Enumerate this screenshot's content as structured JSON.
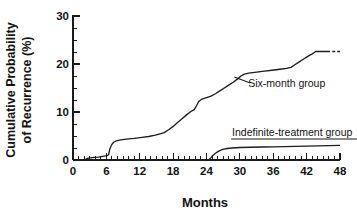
{
  "chart_data": {
    "type": "line",
    "title": "",
    "xlabel": "Months",
    "ylabel": "Cumulative Probability of Recurrence (%)",
    "ylabel_line1": "Cumulative Probability",
    "ylabel_line2": "of Recurrence (%)",
    "xlim": [
      0,
      48
    ],
    "ylim": [
      0,
      30
    ],
    "grid": false,
    "legend_position": "inline-annotations",
    "xticks": [
      0,
      6,
      12,
      18,
      24,
      30,
      36,
      42,
      48
    ],
    "xticklabels": [
      "0",
      "6",
      "12",
      "18",
      "24",
      "30",
      "36",
      "42",
      "48"
    ],
    "xminor_interval": 1,
    "yticks": [
      0,
      10,
      20,
      30
    ],
    "yticklabels": [
      "0",
      "10",
      "20",
      "30"
    ],
    "yminor_interval": 2.5,
    "series": [
      {
        "name": "Six-month group",
        "label": "Six-month group",
        "color": "#1c1c1c",
        "annotation_x": 31.5,
        "annotation_y": 15.2,
        "leader_from_x": 29.0,
        "leader_from_y": 17.3,
        "points": [
          [
            0.0,
            0.0
          ],
          [
            2.0,
            0.0
          ],
          [
            2.6,
            0.35
          ],
          [
            3.4,
            0.5
          ],
          [
            4.6,
            0.6
          ],
          [
            5.6,
            0.8
          ],
          [
            6.1,
            0.9
          ],
          [
            6.4,
            1.1
          ],
          [
            6.6,
            2.2
          ],
          [
            6.9,
            3.1
          ],
          [
            7.3,
            3.7
          ],
          [
            7.8,
            4.0
          ],
          [
            8.6,
            4.2
          ],
          [
            9.6,
            4.35
          ],
          [
            11.0,
            4.5
          ],
          [
            12.4,
            4.7
          ],
          [
            13.6,
            4.9
          ],
          [
            14.8,
            5.2
          ],
          [
            15.8,
            5.5
          ],
          [
            16.4,
            5.7
          ],
          [
            17.2,
            6.3
          ],
          [
            18.0,
            7.0
          ],
          [
            18.8,
            7.8
          ],
          [
            19.6,
            8.6
          ],
          [
            20.4,
            9.4
          ],
          [
            21.2,
            10.1
          ],
          [
            21.8,
            10.5
          ],
          [
            22.2,
            11.3
          ],
          [
            22.6,
            12.2
          ],
          [
            23.2,
            12.7
          ],
          [
            24.0,
            13.0
          ],
          [
            24.8,
            13.3
          ],
          [
            25.6,
            13.8
          ],
          [
            26.4,
            14.4
          ],
          [
            27.2,
            15.0
          ],
          [
            28.0,
            15.6
          ],
          [
            28.8,
            16.2
          ],
          [
            29.6,
            16.9
          ],
          [
            30.2,
            17.5
          ],
          [
            30.8,
            17.9
          ],
          [
            31.6,
            18.1
          ],
          [
            33.0,
            18.3
          ],
          [
            34.4,
            18.5
          ],
          [
            35.8,
            18.7
          ],
          [
            37.2,
            18.9
          ],
          [
            38.4,
            19.1
          ],
          [
            39.2,
            19.3
          ],
          [
            39.8,
            19.8
          ],
          [
            40.6,
            20.4
          ],
          [
            41.4,
            21.0
          ],
          [
            42.2,
            21.6
          ],
          [
            43.0,
            22.1
          ],
          [
            43.4,
            22.4
          ],
          [
            43.6,
            22.6
          ],
          [
            45.0,
            22.6
          ],
          [
            46.2,
            22.6
          ]
        ],
        "dashed_tail": [
          [
            46.6,
            22.6
          ],
          [
            48.0,
            22.6
          ]
        ]
      },
      {
        "name": "Indefinite-treatment group",
        "label": "Indefinite-treatment group",
        "color": "#1c1c1c",
        "annotation_x": 28.6,
        "annotation_y": 5.0,
        "leader_from_x": 27.0,
        "leader_from_y": 4.2,
        "points": [
          [
            0.0,
            0.0
          ],
          [
            12.0,
            0.0
          ],
          [
            20.0,
            0.0
          ],
          [
            24.4,
            0.0
          ],
          [
            24.7,
            0.35
          ],
          [
            25.1,
            0.9
          ],
          [
            25.6,
            1.4
          ],
          [
            26.2,
            1.85
          ],
          [
            26.9,
            2.2
          ],
          [
            27.7,
            2.4
          ],
          [
            28.6,
            2.5
          ],
          [
            30.0,
            2.6
          ],
          [
            32.0,
            2.65
          ],
          [
            34.0,
            2.7
          ],
          [
            36.0,
            2.75
          ],
          [
            38.0,
            2.8
          ],
          [
            40.0,
            2.85
          ],
          [
            42.0,
            2.9
          ],
          [
            44.0,
            2.95
          ],
          [
            46.0,
            3.0
          ],
          [
            48.0,
            3.05
          ]
        ],
        "dashed_tail": []
      }
    ]
  },
  "figure": {
    "background_color": "#ffffff",
    "axis_color": "#1a1a1a",
    "text_color": "#131313"
  }
}
